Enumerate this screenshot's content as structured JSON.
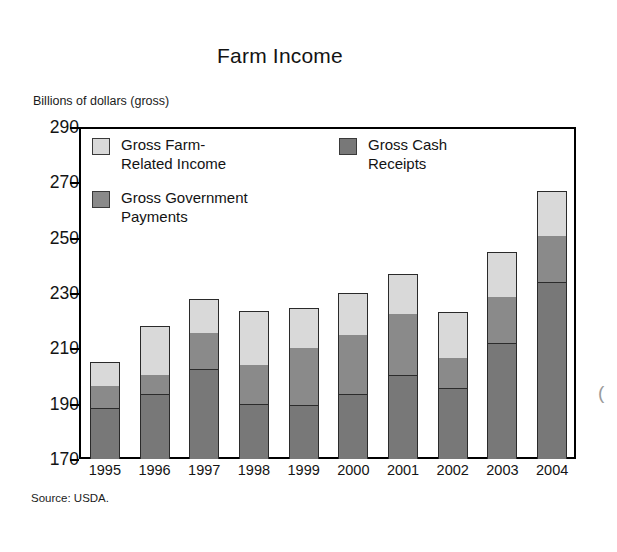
{
  "chart_data": {
    "type": "bar",
    "subtype": "stacked-vertical",
    "title": "Farm Income",
    "ylabel": "Billions of dollars (gross)",
    "xlabel": "",
    "source": "Source: USDA.",
    "ylim": [
      170,
      290
    ],
    "yticks": [
      290,
      270,
      250,
      230,
      210,
      190,
      170
    ],
    "grid": false,
    "legend_position": "inside-top-left",
    "categories": [
      "1995",
      "1996",
      "1997",
      "1998",
      "1999",
      "2000",
      "2001",
      "2002",
      "2003",
      "2004"
    ],
    "stack_order_bottom_to_top": [
      "Gross Cash Receipts",
      "Gross Government Payments",
      "Gross Farm-Related Income"
    ],
    "series": [
      {
        "name": "Gross Cash Receipts",
        "color": "#787878",
        "cumulative_top": [
          188.5,
          193.5,
          202.5,
          190.0,
          189.5,
          193.5,
          200.5,
          195.5,
          212.0,
          234.0
        ],
        "values": [
          18.5,
          23.5,
          32.5,
          20.0,
          19.5,
          23.5,
          30.5,
          25.5,
          42.0,
          64.0
        ]
      },
      {
        "name": "Gross Government Payments",
        "color": "#8a8a8a",
        "cumulative_top": [
          196.5,
          200.5,
          215.5,
          204.0,
          210.0,
          215.0,
          222.5,
          206.5,
          228.5,
          250.5
        ],
        "values": [
          8.0,
          7.0,
          13.0,
          14.0,
          20.5,
          21.5,
          22.0,
          11.0,
          16.5,
          16.5
        ]
      },
      {
        "name": "Gross Farm-Related Income",
        "color": "#d9d9d9",
        "cumulative_top": [
          205.0,
          218.0,
          228.0,
          223.5,
          224.5,
          230.0,
          237.0,
          223.0,
          245.0,
          267.0
        ],
        "values": [
          8.5,
          17.5,
          12.5,
          19.5,
          14.5,
          15.0,
          14.5,
          16.5,
          16.5,
          16.5
        ]
      }
    ],
    "totals": [
      205.0,
      218.0,
      228.0,
      223.5,
      224.5,
      230.0,
      237.0,
      223.0,
      245.0,
      267.0
    ]
  },
  "legend": {
    "items": [
      {
        "label": "Gross Farm-\nRelated Income",
        "color": "#d9d9d9"
      },
      {
        "label": "Gross Government\nPayments",
        "color": "#8a8a8a"
      },
      {
        "label": "Gross Cash\nReceipts",
        "color": "#787878"
      }
    ]
  },
  "axes": {
    "y_tick_labels": [
      "290",
      "270",
      "250",
      "230",
      "210",
      "190",
      "170"
    ],
    "x_tick_labels": [
      "1995",
      "1996",
      "1997",
      "1998",
      "1999",
      "2000",
      "2001",
      "2002",
      "2003",
      "2004"
    ]
  },
  "edge_artifact": "("
}
